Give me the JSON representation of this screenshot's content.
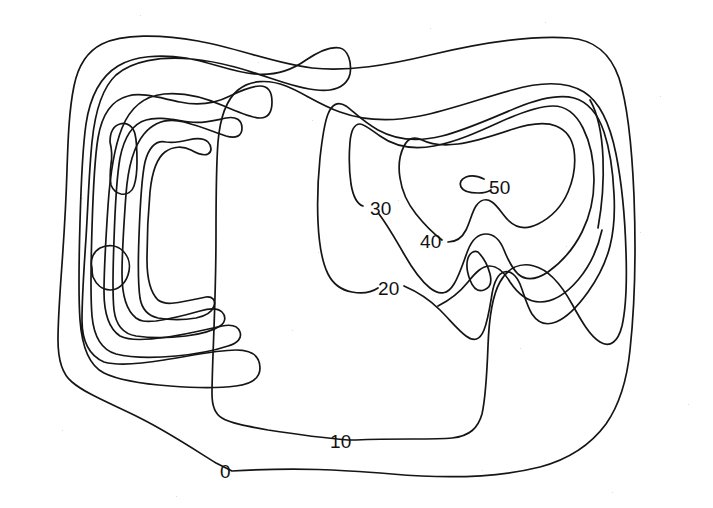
{
  "figure": {
    "type": "contour-map",
    "title": "",
    "background_color": "#ffffff",
    "line_color": "#151515",
    "width": 713,
    "height": 508
  },
  "chart_data": {
    "type": "contour",
    "title": "",
    "subtitle": "",
    "xlabel": "",
    "ylabel": "",
    "grid": false,
    "legend": "none",
    "axes_visible": false,
    "contour_interval": 10,
    "units": "",
    "levels": [
      0,
      10,
      20,
      30,
      40,
      50
    ],
    "labeled_levels": [
      "0",
      "10",
      "20",
      "30",
      "40",
      "50"
    ],
    "highs": [
      {
        "name": "west-high",
        "approx_level": 50,
        "closed_loops": 2,
        "x_frac": 0.15,
        "y_frac": 0.42
      },
      {
        "name": "east-high",
        "approx_level": 50,
        "closed_loops": 1,
        "x_frac": 0.7,
        "y_frac": 0.37
      }
    ],
    "saddle": {
      "name": "central-saddle",
      "x_frac": 0.67,
      "y_frac": 0.53
    }
  },
  "labels": [
    {
      "id": "label-50",
      "text": "50",
      "level": 50,
      "x": 489,
      "y": 178
    },
    {
      "id": "label-40",
      "text": "40",
      "level": 40,
      "x": 420,
      "y": 232
    },
    {
      "id": "label-30",
      "text": "30",
      "level": 30,
      "x": 370,
      "y": 199
    },
    {
      "id": "label-20",
      "text": "20",
      "level": 20,
      "x": 378,
      "y": 279
    },
    {
      "id": "label-10",
      "text": "10",
      "level": 10,
      "x": 330,
      "y": 432
    },
    {
      "id": "label-0",
      "text": "0",
      "level": 0,
      "x": 220,
      "y": 462
    }
  ],
  "contours": [
    {
      "id": "level-0-outer",
      "level": 0,
      "closed": true,
      "label_gap": true,
      "d": "M 232 471 C 300 467 340 470 392 474 C 450 479 500 477 540 467 C 570 459 592 443 606 424 C 620 404 627 380 630 350 C 635 304 636 250 634 196 C 632 148 628 106 619 78 C 610 52 594 40 570 38 C 530 35 476 44 430 55 C 388 65 348 72 312 68 C 272 63 238 48 198 41 C 160 34 122 34 102 44 C 86 52 78 66 74 86 C 69 110 68 140 67 170 C 66 204 64 236 62 264 C 60 292 58 318 58 340 C 58 360 62 374 72 382 C 86 394 112 404 140 418 C 170 433 198 452 216 463 Z"
    },
    {
      "id": "level-10-west-lobe",
      "level": 10,
      "closed": true,
      "label_gap": false,
      "d": "M 104 362 C 88 355 82 340 82 320 C 82 296 84 268 86 238 C 88 206 89 172 92 142 C 95 112 102 88 116 75 C 132 61 160 56 192 59 C 224 62 252 72 276 80 C 300 88 318 92 330 90 C 342 88 348 82 350 74 C 352 62 348 50 340 48 C 330 46 318 52 306 60 C 292 70 274 76 254 74 C 232 72 210 62 186 58 C 160 54 134 56 118 66 C 100 77 90 97 86 124 C 82 152 81 186 80 222 C 79 258 78 292 80 320 C 82 348 90 366 104 373 C 120 381 144 384 170 386 C 196 388 220 388 236 386 C 252 384 260 378 260 368 C 260 356 252 350 236 350 C 216 350 190 356 164 360 C 140 364 118 366 104 362 Z"
    },
    {
      "id": "level-10-main",
      "level": 10,
      "closed": true,
      "label_gap": true,
      "d": "M 356 440 C 398 438 432 440 452 438 C 470 436 478 428 482 414 C 486 396 487 372 488 346 C 489 318 492 296 500 282 C 508 268 520 262 534 266 C 550 270 562 286 572 304 C 582 322 590 336 600 342 C 610 348 618 342 622 326 C 626 308 627 282 626 252 C 625 218 622 184 616 154 C 610 124 600 102 584 92 C 566 81 540 82 512 90 C 482 98 450 110 420 116 C 390 122 362 120 340 112 C 318 104 302 92 286 86 C 268 79 250 80 238 90 C 226 100 220 118 218 142 C 216 168 216 200 216 234 C 216 268 215 300 214 328 C 213 356 212 378 212 394 C 212 406 215 414 222 418 C 230 423 246 426 268 430 C 294 434 324 438 348 440 Z"
    },
    {
      "id": "level-10-west-inner",
      "level": 10,
      "closed": true,
      "label_gap": false,
      "d": "M 120 336 C 108 328 104 312 104 292 C 104 266 106 236 108 206 C 110 176 114 148 122 128 C 130 108 144 96 164 94 C 184 92 206 98 224 106 C 240 113 252 118 260 118 C 268 118 272 112 272 102 C 272 92 268 86 260 86 C 252 86 242 90 230 96 C 216 103 198 106 180 102 C 160 98 142 92 128 96 C 112 100 102 114 98 138 C 94 162 93 194 92 228 C 91 262 90 292 92 316 C 94 338 102 350 116 354 C 132 358 154 358 176 356 C 198 354 216 350 228 346 C 238 343 242 338 240 332 C 238 326 232 324 222 326 C 208 329 188 334 168 337 C 146 340 130 341 120 336 Z"
    },
    {
      "id": "level-20-west",
      "level": 20,
      "closed": true,
      "label_gap": false,
      "d": "M 136 318 C 126 310 122 294 122 274 C 122 250 124 222 126 194 C 128 168 134 146 144 134 C 154 122 168 118 184 122 C 200 126 214 132 226 136 C 236 139 242 136 242 128 C 242 120 236 116 226 118 C 216 120 204 124 190 122 C 174 120 158 116 146 120 C 132 124 124 138 120 158 C 116 180 115 210 114 240 C 113 268 112 292 114 310 C 116 326 124 334 136 336 C 150 338 168 338 186 336 C 202 334 214 330 220 326 C 226 322 226 316 222 312 C 218 308 210 308 200 311 C 186 315 170 319 156 321 C 144 322 140 321 136 318 Z"
    },
    {
      "id": "level-30-west",
      "level": 30,
      "closed": true,
      "label_gap": false,
      "d": "M 158 300 C 150 292 147 278 147 260 C 147 238 148 214 150 192 C 152 172 157 158 165 152 C 173 146 183 146 191 150 C 198 154 204 156 208 154 C 212 152 212 146 208 142 C 204 138 196 138 188 140 C 180 142 172 143 166 142 C 156 140 149 147 145 162 C 141 180 140 208 139 236 C 138 262 138 284 140 298 C 142 310 149 316 158 318 C 170 320 184 320 196 318 C 206 316 212 312 214 306 C 216 300 212 296 206 297 C 196 299 184 302 174 303 C 166 304 162 303 158 300 Z"
    },
    {
      "id": "level-40-west-upper",
      "level": 40,
      "closed": true,
      "label_gap": false,
      "d": "M 110 142 C 110 132 113 126 120 124 C 127 122 133 126 135 134 C 137 142 137 152 137 162 C 137 172 136 180 134 186 C 132 192 127 195 121 194 C 116 193 113 190 111 185 C 110 180 110 172 111 164 C 112 158 112 150 110 142 Z"
    },
    {
      "id": "level-40-west-lower",
      "level": 40,
      "closed": true,
      "label_gap": false,
      "d": "M 92 268 C 90 260 93 252 100 248 C 108 244 117 245 123 251 C 129 257 131 266 128 275 C 125 284 118 290 110 290 C 102 290 96 284 93 277 C 92 274 92 271 92 268 Z"
    },
    {
      "id": "level-20-east",
      "level": 20,
      "closed": false,
      "label_gap": true,
      "d": "M 404 286 C 418 292 430 300 440 310 C 450 320 458 330 466 336 C 474 342 480 340 484 330 C 488 320 490 306 492 294 C 494 282 498 274 504 272 C 510 270 516 275 520 284 C 524 294 527 306 532 314 C 538 323 546 326 556 322 C 568 317 578 306 588 292 C 598 278 606 262 610 246 C 614 230 615 212 614 194 C 613 172 610 150 604 132 C 598 114 588 102 574 98 C 558 94 538 99 516 108 C 492 118 466 130 442 136 C 418 142 396 140 378 130 C 362 121 352 110 346 106 C 338 101 332 104 328 114 C 324 124 322 140 320 158 C 318 178 317 200 318 222 C 319 244 322 262 328 274 C 333 284 341 290 352 292 C 362 294 372 292 378 288"
    },
    {
      "id": "level-30-east",
      "level": 30,
      "closed": false,
      "label_gap": true,
      "d": "M 379 214 C 388 226 396 240 404 254 C 412 268 420 280 430 288 C 440 296 448 294 454 284 C 460 274 464 260 468 250 C 472 240 478 234 486 234 C 494 234 500 240 504 250 C 508 260 512 268 518 274 C 526 281 536 280 548 272 C 562 262 574 248 582 232 C 590 216 594 198 594 180 C 594 160 590 142 583 128 C 576 114 566 106 553 106 C 538 106 520 113 500 122 C 478 132 456 142 434 146 C 412 150 394 146 380 136 C 370 129 364 124 360 124 C 354 124 351 131 350 142 C 349 154 349 170 351 184 C 353 196 357 204 363 206"
    },
    {
      "id": "level-40-east",
      "level": 40,
      "closed": false,
      "label_gap": true,
      "d": "M 448 242 C 456 242 462 238 466 230 C 470 222 472 212 476 206 C 480 200 486 198 492 202 C 498 206 502 214 508 220 C 516 228 526 230 538 224 C 552 217 562 206 568 192 C 574 178 576 164 574 150 C 572 138 566 130 556 126 C 544 121 528 124 510 130 C 492 136 474 142 458 144 C 442 146 430 144 422 140 C 414 136 408 138 404 146 C 400 154 398 166 400 178 C 402 192 408 204 416 214 C 424 224 434 234 442 240"
    },
    {
      "id": "level-50-east",
      "level": 50,
      "closed": false,
      "label_gap": true,
      "d": "M 484 179 C 478 176 471 175 466 177 C 461 179 459 183 461 187 C 463 191 470 193 478 193 C 483 193 488 192 491 190"
    },
    {
      "id": "level-20-eastwrap",
      "level": 20,
      "closed": false,
      "label_gap": false,
      "d": "M 478 252 C 484 258 488 266 490 274 C 492 282 490 288 484 290 C 478 292 473 288 470 280 C 467 272 466 264 468 258 C 470 253 474 250 478 252 Z"
    },
    {
      "id": "level-10-eastwrap",
      "level": 10,
      "closed": false,
      "label_gap": false,
      "d": "M 438 306 C 450 300 460 292 468 282 C 476 272 482 266 490 266 C 498 266 504 272 510 282 C 518 294 528 302 540 302 C 554 302 566 294 578 280 C 590 266 598 248 602 230"
    },
    {
      "id": "level-10-right-edge",
      "level": 10,
      "closed": false,
      "label_gap": false,
      "d": "M 598 228 C 602 206 604 182 603 158 C 602 134 598 114 590 100"
    }
  ],
  "specks": [
    {
      "x": 140,
      "y": 15
    },
    {
      "x": 430,
      "y": 28
    },
    {
      "x": 545,
      "y": 22
    },
    {
      "x": 312,
      "y": 120
    },
    {
      "x": 660,
      "y": 96
    },
    {
      "x": 82,
      "y": 198
    },
    {
      "x": 318,
      "y": 252
    },
    {
      "x": 640,
      "y": 232
    },
    {
      "x": 566,
      "y": 246
    },
    {
      "x": 292,
      "y": 330
    },
    {
      "x": 62,
      "y": 430
    },
    {
      "x": 482,
      "y": 470
    },
    {
      "x": 688,
      "y": 404
    },
    {
      "x": 176,
      "y": 496
    },
    {
      "x": 612,
      "y": 492
    },
    {
      "x": 258,
      "y": 62
    },
    {
      "x": 398,
      "y": 200
    },
    {
      "x": 520,
      "y": 348
    }
  ]
}
